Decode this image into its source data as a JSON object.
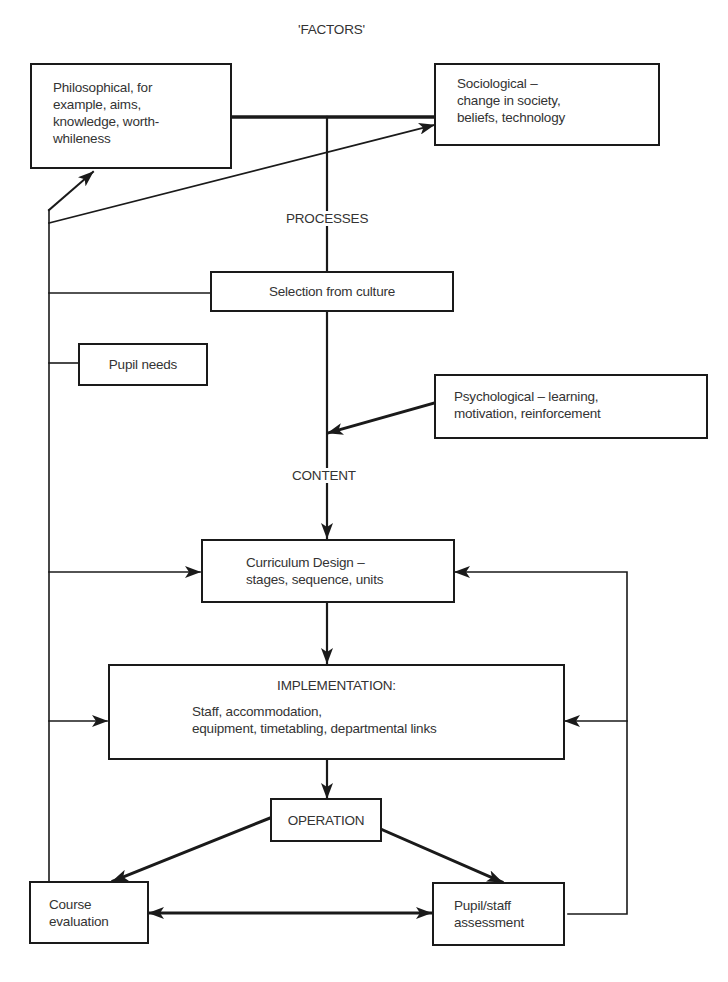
{
  "title": "'FACTORS'",
  "labels": {
    "processes": "PROCESSES",
    "content": "CONTENT"
  },
  "nodes": {
    "philosophical": "Philosophical, for\nexample, aims,\nknowledge, worth-\nwhileness",
    "sociological": "Sociological –\nchange in society,\nbeliefs, technology",
    "selection": "Selection from culture",
    "pupil_needs": "Pupil needs",
    "psychological": "Psychological – learning,\nmotivation, reinforcement",
    "curriculum": "Curriculum Design –\nstages, sequence, units",
    "implementation_title": "IMPLEMENTATION:",
    "implementation_body": "Staff, accommodation,\nequipment, timetabling, departmental links",
    "operation": "OPERATION",
    "course_evaluation": "Course\nevaluation",
    "assessment": "Pupil/staff\nassessment"
  },
  "colors": {
    "line": "#1a1a1a",
    "text": "#333333",
    "background": "#ffffff"
  }
}
